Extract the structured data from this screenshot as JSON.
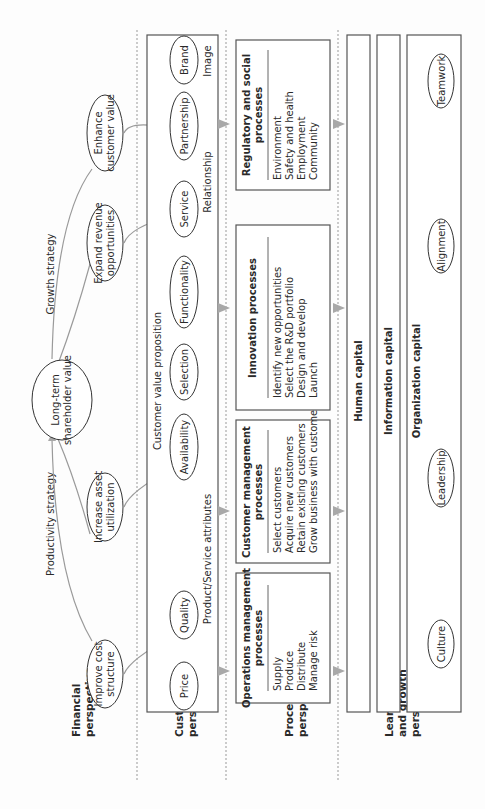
{
  "perspectives": {
    "financial": [
      "Financial",
      "perspective"
    ],
    "customer": [
      "Customer",
      "perspective"
    ],
    "process": [
      "Process",
      "perspective"
    ],
    "learning": [
      "Learning",
      "and growth",
      "perspective"
    ]
  },
  "financial": {
    "long_term": [
      "Long-term",
      "shareholder value"
    ],
    "productivity_strategy": "Productivity strategy",
    "growth_strategy": "Growth strategy",
    "improve_cost": [
      "Improve cost",
      "structure"
    ],
    "increase_asset": [
      "Increase asset",
      "utilization"
    ],
    "expand_revenue": [
      "Expand revenue",
      "opportunities"
    ],
    "enhance_customer": [
      "Enhance",
      "customer value"
    ]
  },
  "customer": {
    "value_proposition": "Customer value proposition",
    "attributes": [
      "Price",
      "Quality",
      "Availability",
      "Selection",
      "Functionality",
      "Service",
      "Partnership",
      "Brand"
    ],
    "group_product": "Product/Service attributes",
    "group_relationship": "Relationship",
    "group_image": "Image"
  },
  "process": {
    "boxes": [
      {
        "title": [
          "Operations management",
          "processes"
        ],
        "items": [
          "Supply",
          "Produce",
          "Distribute",
          "Manage risk"
        ]
      },
      {
        "title": [
          "Customer management",
          "processes"
        ],
        "items": [
          "Select customers",
          "Acquire new customers",
          "Retain existing customers",
          "Grow business with customers"
        ]
      },
      {
        "title": [
          "Innovation processes"
        ],
        "items": [
          "Identify new opportunities",
          "Select the R&D portfolio",
          "Design and develop",
          "Launch"
        ]
      },
      {
        "title": [
          "Regulatory and social",
          "processes"
        ],
        "items": [
          "Environment",
          "Safety and health",
          "Employment",
          "Community"
        ]
      }
    ]
  },
  "learning": {
    "human_capital": "Human capital",
    "information_capital": "Information capital",
    "organization_capital": "Organization capital",
    "org_items": [
      "Culture",
      "Leadership",
      "Alignment",
      "Teamwork"
    ]
  }
}
